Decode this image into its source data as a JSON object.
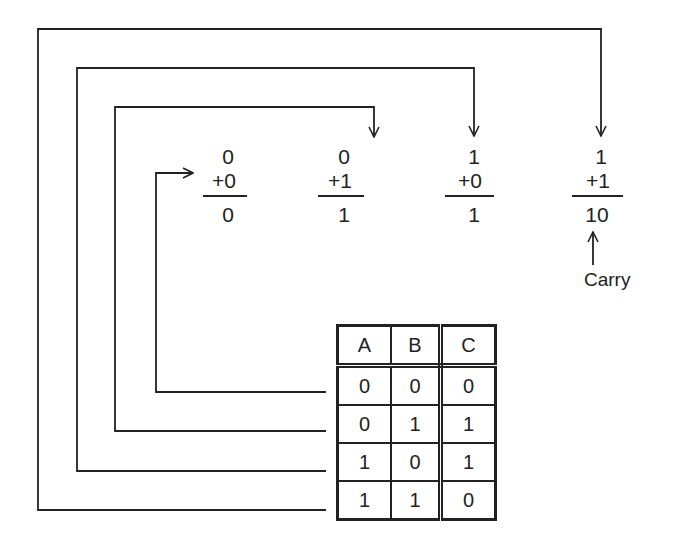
{
  "additions": [
    {
      "augend": "0",
      "addend": "+0",
      "sum": "0"
    },
    {
      "augend": "0",
      "addend": "+1",
      "sum": "1"
    },
    {
      "augend": "1",
      "addend": "+0",
      "sum": "1"
    },
    {
      "augend": "1",
      "addend": "+1",
      "sum": "10"
    }
  ],
  "carry_label": "Carry",
  "truth_table": {
    "headers": [
      "A",
      "B",
      "C"
    ],
    "rows": [
      [
        "0",
        "0",
        "0"
      ],
      [
        "0",
        "1",
        "1"
      ],
      [
        "1",
        "0",
        "1"
      ],
      [
        "1",
        "1",
        "0"
      ]
    ]
  },
  "colors": {
    "line": "#222222",
    "background": "#ffffff"
  }
}
